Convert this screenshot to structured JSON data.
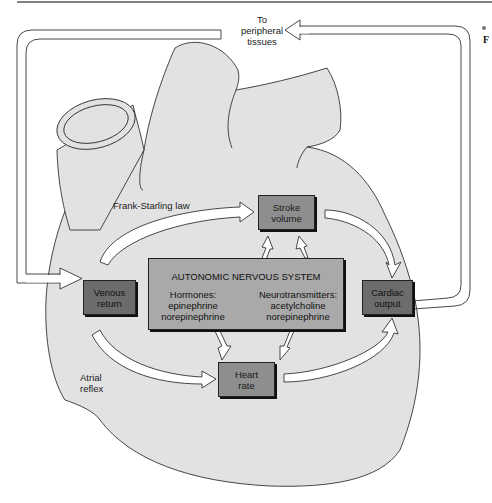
{
  "diagram": {
    "type": "cardiac-output-regulation",
    "top_label": "To\nperipheral\ntissues",
    "top_label_lines": [
      "To",
      "peripheral",
      "tissues"
    ],
    "edge_marker": "F",
    "nodes": {
      "venous_return": {
        "lines": [
          "Venous",
          "return"
        ]
      },
      "stroke_volume": {
        "lines": [
          "Stroke",
          "volume"
        ]
      },
      "heart_rate": {
        "lines": [
          "Heart",
          "rate"
        ]
      },
      "cardiac_output": {
        "lines": [
          "Cardiac",
          "output"
        ]
      },
      "ans": {
        "title": "AUTONOMIC NERVOUS SYSTEM",
        "hormones": {
          "lines": [
            "Hormones:",
            "epinephrine",
            "norepinephrine"
          ]
        },
        "neurotransmitters": {
          "lines": [
            "Neurotransmitters:",
            "acetylcholine",
            "norepinephrine"
          ]
        }
      }
    },
    "edge_labels": {
      "frank_starling": "Frank-Starling law",
      "atrial_reflex": {
        "lines": [
          "Atrial",
          "reflex"
        ]
      }
    },
    "colors": {
      "heart_fill": "#e2e2e2",
      "dark_box": "#6c6c6c",
      "mid_box": "#8e8e8e",
      "ans_box": "#a9a9a9",
      "stroke": "#222222"
    }
  }
}
